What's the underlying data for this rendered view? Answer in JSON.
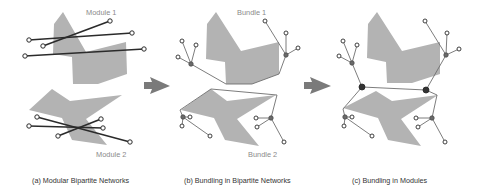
{
  "figure": {
    "panels": [
      {
        "id": "a",
        "caption": "(a) Modular Bipartite Networks",
        "labels": [
          "Module 1",
          "Module 2"
        ]
      },
      {
        "id": "b",
        "caption": "(b) Bundling in Bipartite Networks",
        "labels": [
          "Bundle 1",
          "Bundle 2"
        ]
      },
      {
        "id": "c",
        "caption": "(c) Bundling in Modules",
        "labels": []
      }
    ],
    "colors": {
      "shape_fill": "#b3b3b3",
      "edge_dark": "#2b2b2b",
      "edge_bundle": "#6e6e6e",
      "arrow": "#7a7a7a",
      "node_fill": "#ffffff",
      "hub_fill": "#6a6a6a",
      "hub_dark": "#333333",
      "label": "#8a8a8a"
    }
  }
}
